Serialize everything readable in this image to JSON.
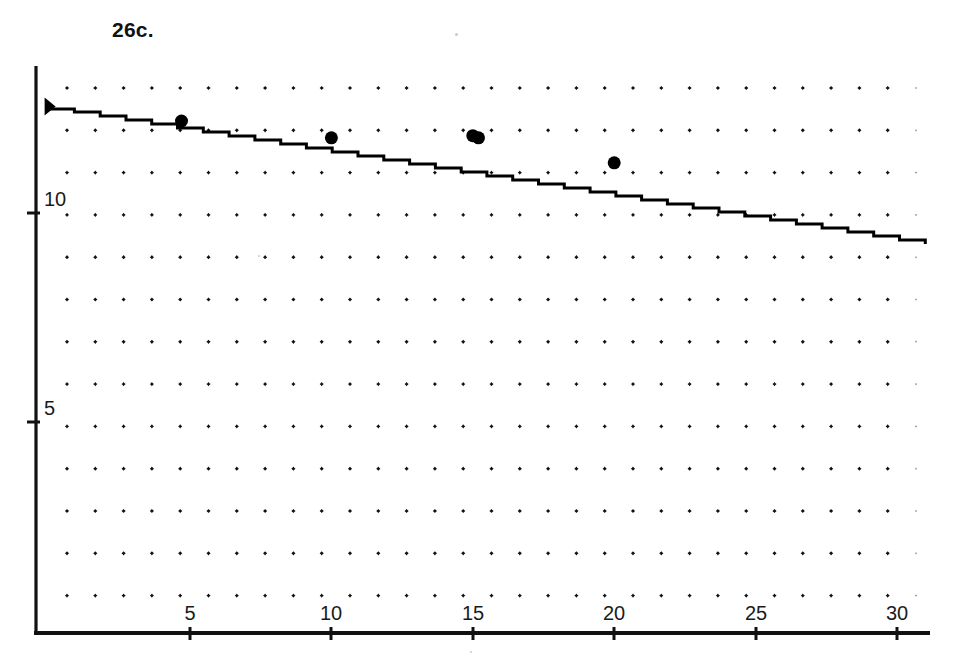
{
  "figure": {
    "title": "26c.",
    "background_color": "#ffffff",
    "ink_color": "#111111"
  },
  "chart_data": {
    "type": "scatter",
    "title": "26c.",
    "xlabel": "",
    "ylabel": "",
    "xlim": [
      0,
      31.5
    ],
    "ylim": [
      0,
      13.5
    ],
    "grid": "dot-grid",
    "grid_style": "regular array of small plus-shaped dots (no gridlines)",
    "x_ticks": [
      5,
      10,
      15,
      20,
      25,
      30
    ],
    "x_tick_labels": [
      "5",
      "10",
      "15",
      "20",
      "25",
      "30"
    ],
    "y_ticks": [
      5,
      10
    ],
    "y_tick_labels": [
      "5",
      "10"
    ],
    "points": [
      {
        "x": 4.7,
        "y": 12.2
      },
      {
        "x": 10.0,
        "y": 11.8
      },
      {
        "x": 15.0,
        "y": 11.85
      },
      {
        "x": 15.2,
        "y": 11.8
      },
      {
        "x": 20.0,
        "y": 11.2
      }
    ],
    "series": [
      {
        "name": "data points",
        "x": [
          4.7,
          10.0,
          15.0,
          20.0
        ],
        "y": [
          12.2,
          11.8,
          11.85,
          11.2
        ],
        "marker": "filled-circle",
        "color": "#000000"
      },
      {
        "name": "regression line",
        "type": "line",
        "x": [
          0,
          31.0
        ],
        "y": [
          12.5,
          9.25
        ],
        "slope": -0.105,
        "intercept": 12.5,
        "color": "#000000",
        "note": "straight fitted line descending left to right"
      }
    ],
    "annotations": [
      {
        "label": "y-intercept marker",
        "x": 0,
        "y": 12.55,
        "marker": "filled-arrow"
      }
    ]
  },
  "axes": {
    "y_axis_label_10": "10",
    "y_axis_label_5": "5",
    "x_axis_labels": [
      "5",
      "10",
      "15",
      "20",
      "25",
      "30"
    ]
  }
}
